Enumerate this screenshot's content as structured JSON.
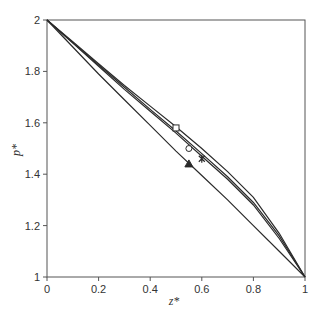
{
  "chart_data": {
    "type": "line",
    "title": "",
    "xlabel": "z*",
    "ylabel": "p*",
    "xlim": [
      0,
      1
    ],
    "ylim": [
      1,
      2
    ],
    "x_ticks": [
      "0",
      "0.2",
      "0.4",
      "0.6",
      "0.8",
      "1"
    ],
    "y_ticks": [
      "1",
      "1.2",
      "1.4",
      "1.6",
      "1.8",
      "2"
    ],
    "grid": false,
    "legend": null,
    "series": [
      {
        "name": "curve-square",
        "marker": "square",
        "marker_at": [
          0.5,
          1.58
        ],
        "x": [
          0,
          0.1,
          0.2,
          0.3,
          0.4,
          0.5,
          0.6,
          0.7,
          0.8,
          0.9,
          1
        ],
        "y": [
          2,
          1.915,
          1.83,
          1.745,
          1.665,
          1.585,
          1.5,
          1.41,
          1.31,
          1.17,
          1
        ]
      },
      {
        "name": "curve-circle",
        "marker": "circle",
        "marker_at": [
          0.55,
          1.5
        ],
        "x": [
          0,
          0.1,
          0.2,
          0.3,
          0.4,
          0.5,
          0.6,
          0.7,
          0.8,
          0.9,
          1
        ],
        "y": [
          2,
          1.91,
          1.82,
          1.73,
          1.645,
          1.56,
          1.47,
          1.38,
          1.28,
          1.15,
          1
        ]
      },
      {
        "name": "curve-star",
        "marker": "star",
        "marker_at": [
          0.6,
          1.46
        ],
        "x": [
          0,
          0.1,
          0.2,
          0.3,
          0.4,
          0.5,
          0.6,
          0.7,
          0.8,
          0.9,
          1
        ],
        "y": [
          2,
          1.912,
          1.825,
          1.738,
          1.652,
          1.568,
          1.48,
          1.39,
          1.29,
          1.16,
          1
        ]
      },
      {
        "name": "curve-triangle",
        "marker": "triangle",
        "marker_at": [
          0.55,
          1.44
        ],
        "x": [
          0,
          0.1,
          0.2,
          0.3,
          0.4,
          0.5,
          0.6,
          0.7,
          0.8,
          0.9,
          1
        ],
        "y": [
          2,
          1.895,
          1.79,
          1.69,
          1.59,
          1.49,
          1.395,
          1.3,
          1.2,
          1.1,
          1
        ]
      }
    ]
  },
  "colors": {
    "axis": "#555555",
    "line": "#2a2a2a",
    "text": "#333333",
    "background": "#ffffff"
  }
}
